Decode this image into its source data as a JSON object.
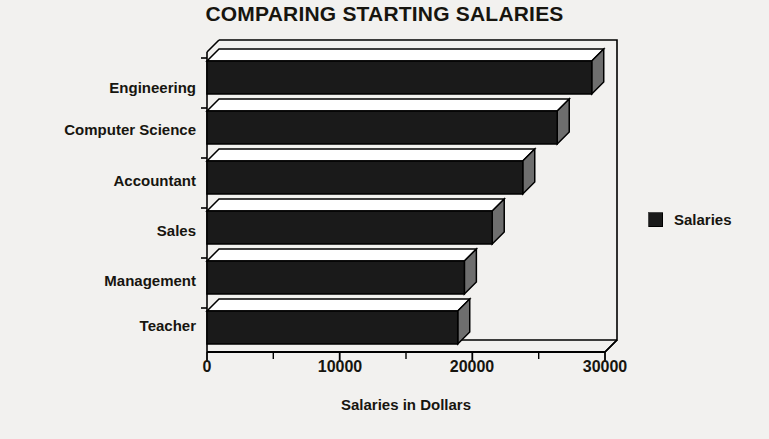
{
  "chart_data": {
    "type": "bar",
    "orientation": "horizontal",
    "title": "COMPARING STARTING SALARIES",
    "xlabel": "Salaries in Dollars",
    "ylabel": "",
    "categories": [
      "Engineering",
      "Computer Science",
      "Accountant",
      "Sales",
      "Management",
      "Teacher"
    ],
    "values": [
      29000,
      26400,
      23800,
      21500,
      19400,
      18900
    ],
    "series": [
      {
        "name": "Salaries",
        "values": [
          29000,
          26400,
          23800,
          21500,
          19400,
          18900
        ],
        "color": "#1a1a1a"
      }
    ],
    "xlim": [
      0,
      30000
    ],
    "xticks": [
      0,
      10000,
      20000,
      30000
    ],
    "xtick_labels": [
      "0",
      "10000",
      "20000",
      "30000"
    ],
    "minor_xticks": [
      5000,
      15000,
      25000
    ],
    "grid": false,
    "legend": {
      "position": "right",
      "entries": [
        {
          "label": "Salaries",
          "color": "#1a1a1a",
          "swatch": "legend-swatch-icon"
        }
      ]
    },
    "style": {
      "three_d": true,
      "bar_face_color": "#1a1a1a",
      "bar_top_color": "#ffffff",
      "bar_side_color": "#6e6e6e",
      "background": "#f2f1ef",
      "frame_color": "#000000"
    }
  }
}
